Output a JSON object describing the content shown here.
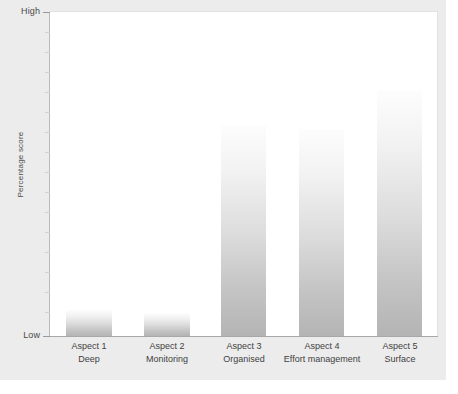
{
  "chart_data": {
    "type": "bar",
    "title": "",
    "subtitle": "",
    "xlabel": "",
    "ylabel": "Percentage score",
    "categories": [
      "Aspect 1",
      "Aspect 2",
      "Aspect 3",
      "Aspect 4",
      "Aspect 5"
    ],
    "category_descriptions": [
      "Deep",
      "Monitoring",
      "Organised",
      "Effort management",
      "Surface"
    ],
    "values": [
      8,
      7,
      65,
      64,
      76
    ],
    "ylim": [
      0,
      100
    ],
    "ytick_labels": [
      "Low",
      "High"
    ],
    "ytick_values": [
      0,
      100
    ],
    "grid": false,
    "legend": null,
    "bar_fill_top_color": "#fdfdfd",
    "bar_fill_bottom_color": "#b4b4b4",
    "plot_background_color": "#ffffff",
    "panel_background_color": "#ececec",
    "axis_color": "#a8a8a8",
    "text_color": "#3f3f3f"
  },
  "axis": {
    "y_high_label": "High",
    "y_low_label": "Low",
    "y_title": "Percentage score"
  },
  "bars": [
    {
      "name": "Aspect 1",
      "desc": "Deep",
      "value": 8
    },
    {
      "name": "Aspect 2",
      "desc": "Monitoring",
      "value": 7
    },
    {
      "name": "Aspect 3",
      "desc": "Organised",
      "value": 65
    },
    {
      "name": "Aspect 4",
      "desc": "Effort management",
      "value": 64
    },
    {
      "name": "Aspect 5",
      "desc": "Surface",
      "value": 76
    }
  ],
  "caption": ""
}
